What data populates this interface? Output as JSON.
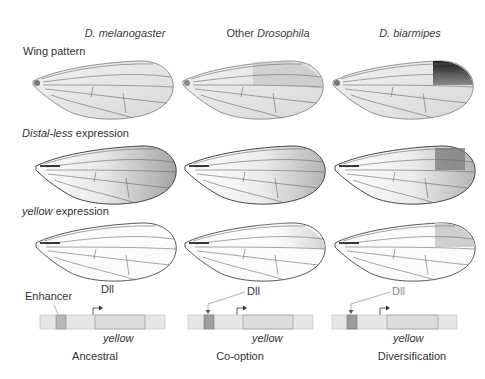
{
  "columns": [
    {
      "species_italic": "D. melanogaster",
      "prefix": "",
      "suffix": ""
    },
    {
      "species_italic": "Drosophila",
      "prefix": "Other ",
      "suffix": ""
    },
    {
      "species_italic": "D. biarmipes",
      "prefix": "",
      "suffix": ""
    }
  ],
  "rows": {
    "wing_pattern": {
      "label": "Wing pattern"
    },
    "distal_less": {
      "label_italic": "Distal-less",
      "label_rest": " expression"
    },
    "yellow_expr": {
      "label_italic": "yellow",
      "label_rest": " expression"
    }
  },
  "gene_diagrams": [
    {
      "enhancer_label": "Enhancer",
      "dll_label": "Dll",
      "gene_label": "yellow",
      "stage": "Ancestral"
    },
    {
      "dll_label": "Dll",
      "gene_label": "yellow",
      "stage": "Co-option"
    },
    {
      "dll_label": "Dll",
      "gene_label": "yellow",
      "stage": "Diversification"
    }
  ],
  "colors": {
    "wing_vein": "#6a6a6a",
    "spot_dark": "#2a2a2a",
    "dll_shading": "#8c8c8c",
    "dna_bar": "#e4e4e4",
    "enhancer_box": "#b8b8b8"
  }
}
